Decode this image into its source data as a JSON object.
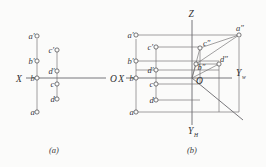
{
  "figure": {
    "title": "",
    "background_color": "#fbfbfa",
    "line_color": "#6f6e70",
    "marker_fill": "#fbfbfa",
    "marker_stroke": "#4d4c4f"
  },
  "panel_a": {
    "caption": "(a)",
    "axis_left_label": "X",
    "axis_right_label": "O",
    "points": [
      {
        "label": "a′",
        "x": 37,
        "y": 36
      },
      {
        "label": "b′",
        "x": 37,
        "y": 61
      },
      {
        "label": "b",
        "x": 37,
        "y": 78
      },
      {
        "label": "a",
        "x": 37,
        "y": 112
      },
      {
        "label": "c′",
        "x": 57,
        "y": 50
      },
      {
        "label": "d′",
        "x": 57,
        "y": 71
      },
      {
        "label": "c",
        "x": 57,
        "y": 84
      },
      {
        "label": "d",
        "x": 57,
        "y": 99
      }
    ]
  },
  "panel_b": {
    "caption": "(b)",
    "axis_x_label": "X",
    "axis_z_label": "Z",
    "axis_yw_label": "Y",
    "axis_yw_sub": "w",
    "axis_yh_label": "Y",
    "axis_yh_sub": "H",
    "origin_label": "O",
    "points_left": [
      {
        "label": "a′",
        "x": 136,
        "y": 36
      },
      {
        "label": "b′",
        "x": 136,
        "y": 61
      },
      {
        "label": "b",
        "x": 136,
        "y": 78
      },
      {
        "label": "a",
        "x": 136,
        "y": 112
      }
    ],
    "points_inner": [
      {
        "label": "c′",
        "x": 156,
        "y": 47
      },
      {
        "label": "d′",
        "x": 156,
        "y": 70
      },
      {
        "label": "c",
        "x": 156,
        "y": 84
      },
      {
        "label": "d",
        "x": 156,
        "y": 100
      }
    ],
    "points_space": [
      {
        "label": "a″",
        "x": 239,
        "y": 35
      },
      {
        "label": "c″",
        "x": 200,
        "y": 48
      },
      {
        "label": "b″",
        "x": 196,
        "y": 64
      },
      {
        "label": "d″",
        "x": 219,
        "y": 64
      }
    ]
  }
}
